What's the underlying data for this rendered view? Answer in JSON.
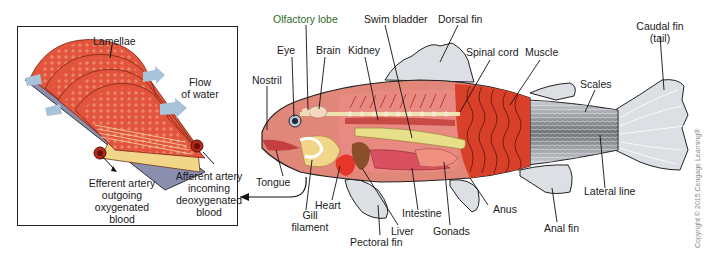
{
  "inset": {
    "title": "Gill structure detail",
    "labels": {
      "lamellae": "Lamellae",
      "flow_line1": "Flow",
      "flow_line2": "of water",
      "efferent_line1": "Efferent artery",
      "efferent_line2": "outgoing",
      "efferent_line3": "oxygenated",
      "efferent_line4": "blood",
      "afferent_line1": "Afferent artery",
      "afferent_line2": "incoming",
      "afferent_line3": "deoxygenated",
      "afferent_line4": "blood"
    }
  },
  "fish": {
    "labels": {
      "olfactory_lobe": "Olfactory lobe",
      "swim_bladder": "Swim bladder",
      "dorsal_fin": "Dorsal fin",
      "caudal_fin_line1": "Caudal fin",
      "caudal_fin_line2": "(tail)",
      "eye": "Eye",
      "brain": "Brain",
      "kidney": "Kidney",
      "spinal_cord": "Spinal cord",
      "muscle": "Muscle",
      "nostril": "Nostril",
      "scales": "Scales",
      "tongue": "Tongue",
      "heart": "Heart",
      "gill_line1": "Gill",
      "gill_line2": "filament",
      "intestine": "Intestine",
      "liver": "Liver",
      "gonads": "Gonads",
      "anus": "Anus",
      "lateral_line": "Lateral line",
      "anal_fin": "Anal fin",
      "pectoral_fin": "Pectoral fin"
    }
  },
  "copyright": "Copyright © 2015 Cengage Learning®",
  "colors": {
    "muscle_red": "#d9402a",
    "body_pink": "#e0877a",
    "fin_gray": "#dcdfe3",
    "swim_bladder_yellow": "#e8df8a",
    "gill_yellow": "#f1d68a",
    "water_arrow_blue": "#a9c3d8",
    "liver_brown": "#8a4f2a",
    "label_green": "#2f6b2a"
  }
}
